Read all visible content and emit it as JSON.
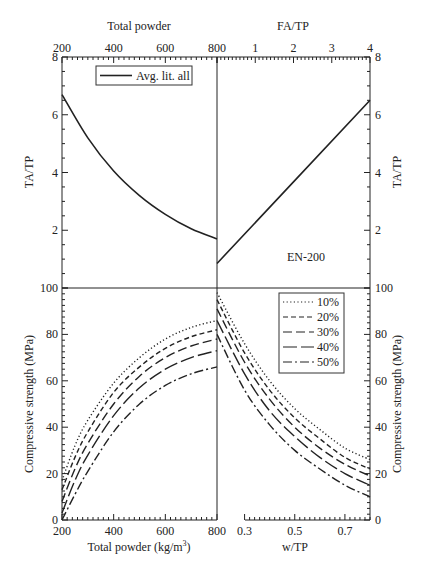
{
  "chart_data": [
    {
      "type": "line",
      "panel": "top-left",
      "title": "",
      "xlabel": "Total powder",
      "ylabel": "TA/TP",
      "xlim": [
        200,
        800
      ],
      "ylim": [
        0,
        8
      ],
      "xticks": [
        "200",
        "400",
        "600",
        "800"
      ],
      "yticks": [
        "2",
        "4",
        "6",
        "8"
      ],
      "legend": [
        "Avg. lit. all"
      ],
      "series": [
        {
          "name": "Avg. lit. all",
          "x": [
            200,
            300,
            400,
            500,
            600,
            700,
            800
          ],
          "y": [
            6.7,
            5.2,
            4.05,
            3.2,
            2.55,
            2.05,
            1.7
          ]
        }
      ]
    },
    {
      "type": "line",
      "panel": "top-right",
      "xlabel": "FA/TP",
      "ylabel": "TA/TP",
      "xlim": [
        0,
        4
      ],
      "ylim": [
        0,
        8
      ],
      "xticks": [
        "1",
        "2",
        "3",
        "4"
      ],
      "yticks": [
        "2",
        "4",
        "6",
        "8"
      ],
      "annotation": "EN-200",
      "series": [
        {
          "name": "Avg. lit. all",
          "x": [
            0,
            4
          ],
          "y": [
            0.85,
            6.5
          ]
        }
      ]
    },
    {
      "type": "line",
      "panel": "bottom-left",
      "xlabel": "Total powder (kg/m3)",
      "ylabel": "Compressive strength (MPa)",
      "xlim": [
        200,
        800
      ],
      "ylim": [
        0,
        100
      ],
      "xticks": [
        "200",
        "400",
        "600",
        "800"
      ],
      "yticks": [
        "0",
        "20",
        "40",
        "60",
        "80",
        "100"
      ],
      "x": [
        200,
        250,
        300,
        400,
        500,
        600,
        700,
        800
      ],
      "series": [
        {
          "name": "10%",
          "values": [
            17,
            32,
            43,
            59,
            70,
            78,
            83,
            86
          ]
        },
        {
          "name": "20%",
          "values": [
            13,
            27,
            38,
            55,
            66,
            74,
            79,
            82
          ]
        },
        {
          "name": "30%",
          "values": [
            8,
            22,
            33,
            50,
            62,
            70,
            75,
            78
          ]
        },
        {
          "name": "40%",
          "values": [
            3,
            17,
            28,
            45,
            57,
            65,
            70,
            73
          ]
        },
        {
          "name": "50%",
          "values": [
            0,
            11,
            21,
            38,
            50,
            58,
            63,
            66
          ]
        }
      ]
    },
    {
      "type": "line",
      "panel": "bottom-right",
      "xlabel": "w/TP",
      "ylabel": "Compressive strength (MPa)",
      "xlim": [
        0.19,
        0.8
      ],
      "ylim": [
        0,
        100
      ],
      "xticks": [
        "0.3",
        "0.5",
        "0.7"
      ],
      "yticks": [
        "0",
        "20",
        "40",
        "60",
        "80",
        "100"
      ],
      "legend": [
        "10%",
        "20%",
        "30%",
        "40%",
        "50%"
      ],
      "x": [
        0.19,
        0.3,
        0.4,
        0.5,
        0.6,
        0.7,
        0.8
      ],
      "series": [
        {
          "name": "10%",
          "values": [
            98,
            76,
            60,
            48,
            39,
            31,
            26
          ]
        },
        {
          "name": "20%",
          "values": [
            95,
            72,
            56,
            44,
            35,
            27,
            22
          ]
        },
        {
          "name": "30%",
          "values": [
            91,
            68,
            52,
            40,
            31,
            24,
            19
          ]
        },
        {
          "name": "40%",
          "values": [
            86,
            63,
            47,
            36,
            27,
            20,
            15
          ]
        },
        {
          "name": "50%",
          "values": [
            80,
            56,
            41,
            30,
            22,
            15,
            10
          ]
        }
      ]
    }
  ],
  "labels": {
    "top_left_xlabel": "Total powder",
    "top_right_xlabel": "FA/TP",
    "left_top_ylabel": "TA/TP",
    "right_top_ylabel": "TA/TP",
    "left_bottom_ylabel": "Compressive strength (MPa)",
    "right_bottom_ylabel": "Compressive strength (MPa)",
    "bottom_left_xlabel": "Total powder (kg/m",
    "bottom_left_xlabel_sup": "3",
    "bottom_left_xlabel_end": ")",
    "bottom_right_xlabel": "w/TP",
    "annotation": "EN-200",
    "legend_top": "Avg. lit. all",
    "legend_bottom": [
      "10%",
      "20%",
      "30%",
      "40%",
      "50%"
    ]
  }
}
